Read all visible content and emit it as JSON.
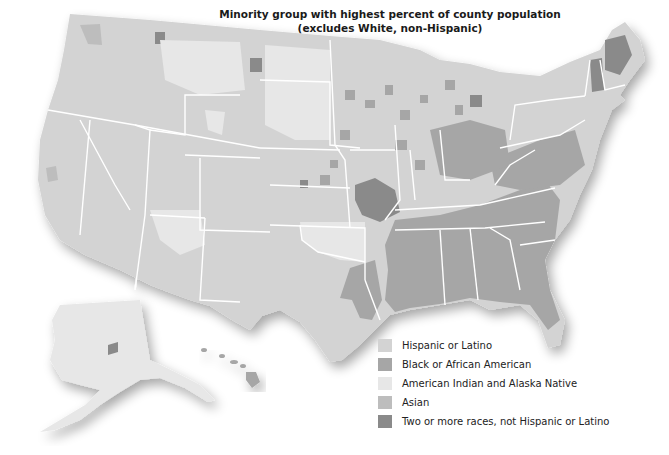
{
  "title": {
    "line1": "Minority group with highest percent of county population",
    "line2": "(excludes White, non-Hispanic)"
  },
  "legend": {
    "items": [
      {
        "label": "Hispanic or Latino",
        "color": "#d3d3d3"
      },
      {
        "label": "Black or African American",
        "color": "#a6a6a6"
      },
      {
        "label": "American Indian and Alaska Native",
        "color": "#e7e7e7"
      },
      {
        "label": "Asian",
        "color": "#bdbdbd"
      },
      {
        "label": "Two or more races, not Hispanic or Latino",
        "color": "#8a8a8a"
      }
    ]
  },
  "map": {
    "regions": [
      "Contiguous United States",
      "Alaska",
      "Hawaii"
    ],
    "colors": {
      "background": "#ffffff",
      "state_border": "#ffffff",
      "hispanic": "#d3d3d3",
      "black": "#a6a6a6",
      "american_indian": "#e7e7e7",
      "asian": "#bdbdbd",
      "two_or_more": "#8a8a8a"
    }
  }
}
